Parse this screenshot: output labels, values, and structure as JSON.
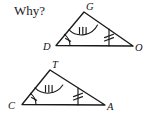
{
  "page": {
    "width": 147,
    "height": 119,
    "background_color": "#ffffff",
    "ink_color": "#1a1a1a"
  },
  "prompt": {
    "text": "Why?",
    "x": 14,
    "y": 14
  },
  "figures": [
    {
      "id": "triangle-dgo",
      "name": "triangle-DGO",
      "vertices": [
        {
          "label": "D",
          "role": "bottom-left",
          "x": 56,
          "y": 45.5,
          "label_x": 43,
          "label_y": 50
        },
        {
          "label": "G",
          "role": "apex",
          "x": 84,
          "y": 12,
          "label_x": 86,
          "label_y": 10
        },
        {
          "label": "O",
          "role": "bottom-right",
          "x": 133,
          "y": 46,
          "label_x": 135,
          "label_y": 51
        }
      ],
      "angle_marks": [
        {
          "at": "D",
          "ticks": 1,
          "radius": 14,
          "name": "angle-mark-d"
        },
        {
          "at": "G",
          "ticks": 3,
          "radius": 18,
          "name": "angle-mark-g"
        }
      ],
      "cevian": {
        "name": "cevian-segment-go",
        "from_x": 109,
        "from_y": 29,
        "to_x": 109,
        "to_y": 46,
        "ticks": 2,
        "tick_center_y": 36
      }
    },
    {
      "id": "triangle-cta",
      "name": "triangle-CTA",
      "vertices": [
        {
          "label": "C",
          "role": "bottom-left",
          "x": 22,
          "y": 104.5,
          "label_x": 9,
          "label_y": 109
        },
        {
          "label": "T",
          "role": "apex",
          "x": 50,
          "y": 70,
          "label_x": 52,
          "label_y": 68
        },
        {
          "label": "A",
          "role": "bottom-right",
          "x": 105,
          "y": 105,
          "label_x": 107,
          "label_y": 110
        }
      ],
      "angle_marks": [
        {
          "at": "C",
          "ticks": 1,
          "radius": 14,
          "name": "angle-mark-c"
        },
        {
          "at": "T",
          "ticks": 3,
          "radius": 18,
          "name": "angle-mark-t"
        }
      ],
      "cevian": {
        "name": "cevian-segment-ta",
        "from_x": 78,
        "from_y": 88,
        "to_x": 78,
        "to_y": 105,
        "ticks": 2,
        "tick_center_y": 95
      }
    }
  ],
  "labels": {
    "d": "D",
    "g": "G",
    "o": "O",
    "c": "C",
    "t": "T",
    "a": "A"
  }
}
